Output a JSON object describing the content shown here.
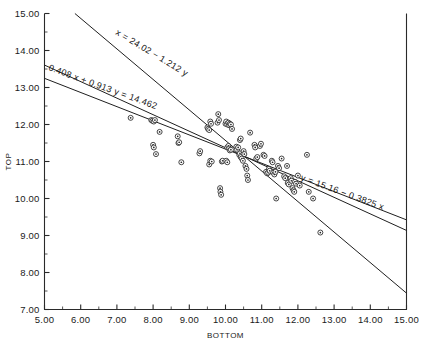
{
  "chart_data": {
    "type": "scatter",
    "title": "",
    "xlabel": "BOTTOM",
    "ylabel": "TOP",
    "xlim": [
      5.0,
      15.0
    ],
    "ylim": [
      7.0,
      15.0
    ],
    "xticks": [
      5.0,
      6.0,
      7.0,
      8.0,
      9.0,
      10.0,
      11.0,
      12.0,
      13.0,
      14.0,
      15.0
    ],
    "yticks": [
      7.0,
      8.0,
      9.0,
      10.0,
      11.0,
      12.0,
      13.0,
      14.0,
      15.0
    ],
    "xtick_labels": [
      "5.00",
      "6.00",
      "7.00",
      "8.00",
      "9.00",
      "10.00",
      "11.00",
      "12.00",
      "13.00",
      "14.00",
      "15.00"
    ],
    "ytick_labels": [
      "7.00",
      "8.00",
      "9.00",
      "10.00",
      "11.00",
      "12.00",
      "13.00",
      "14.00",
      "15.00"
    ],
    "minor_tick_step": 0.5,
    "grid": false,
    "legend": "none",
    "marker": "circle-with-center-dot",
    "points": [
      [
        7.38,
        12.18
      ],
      [
        7.95,
        12.12
      ],
      [
        7.98,
        12.1
      ],
      [
        8.02,
        12.08
      ],
      [
        8.05,
        12.12
      ],
      [
        8.0,
        11.45
      ],
      [
        8.02,
        11.38
      ],
      [
        8.08,
        11.2
      ],
      [
        8.18,
        11.8
      ],
      [
        8.68,
        11.68
      ],
      [
        8.7,
        11.5
      ],
      [
        8.72,
        11.52
      ],
      [
        8.78,
        10.98
      ],
      [
        9.28,
        11.22
      ],
      [
        9.3,
        11.28
      ],
      [
        9.5,
        11.92
      ],
      [
        9.52,
        11.88
      ],
      [
        9.55,
        11.85
      ],
      [
        9.58,
        12.08
      ],
      [
        9.6,
        12.02
      ],
      [
        9.55,
        10.92
      ],
      [
        9.58,
        11.02
      ],
      [
        9.62,
        11.0
      ],
      [
        9.78,
        12.05
      ],
      [
        9.8,
        12.28
      ],
      [
        9.82,
        12.12
      ],
      [
        9.85,
        10.28
      ],
      [
        9.86,
        10.18
      ],
      [
        9.88,
        10.1
      ],
      [
        9.9,
        11.0
      ],
      [
        9.92,
        11.02
      ],
      [
        10.0,
        12.02
      ],
      [
        10.02,
        12.08
      ],
      [
        10.05,
        12.0
      ],
      [
        10.08,
        12.05
      ],
      [
        10.1,
        11.98
      ],
      [
        10.12,
        12.02
      ],
      [
        10.15,
        12.0
      ],
      [
        10.05,
        11.38
      ],
      [
        10.08,
        11.42
      ],
      [
        10.1,
        11.35
      ],
      [
        10.12,
        11.3
      ],
      [
        10.15,
        11.32
      ],
      [
        10.02,
        11.02
      ],
      [
        10.05,
        10.98
      ],
      [
        10.18,
        11.88
      ],
      [
        10.3,
        11.4
      ],
      [
        10.32,
        11.32
      ],
      [
        10.35,
        11.38
      ],
      [
        10.4,
        11.58
      ],
      [
        10.42,
        11.62
      ],
      [
        10.38,
        11.18
      ],
      [
        10.4,
        11.22
      ],
      [
        10.42,
        11.12
      ],
      [
        10.45,
        11.08
      ],
      [
        10.48,
        11.02
      ],
      [
        10.5,
        11.28
      ],
      [
        10.52,
        11.2
      ],
      [
        10.55,
        10.88
      ],
      [
        10.58,
        10.8
      ],
      [
        10.6,
        10.62
      ],
      [
        10.62,
        10.5
      ],
      [
        10.68,
        11.78
      ],
      [
        10.8,
        11.45
      ],
      [
        10.82,
        11.38
      ],
      [
        10.85,
        11.08
      ],
      [
        10.88,
        11.12
      ],
      [
        10.95,
        11.42
      ],
      [
        10.98,
        11.48
      ],
      [
        11.05,
        11.18
      ],
      [
        11.08,
        11.15
      ],
      [
        11.12,
        10.72
      ],
      [
        11.15,
        10.68
      ],
      [
        11.18,
        10.7
      ],
      [
        11.2,
        10.8
      ],
      [
        11.22,
        10.75
      ],
      [
        11.28,
        11.02
      ],
      [
        11.3,
        10.98
      ],
      [
        11.32,
        10.7
      ],
      [
        11.35,
        10.65
      ],
      [
        11.38,
        10.72
      ],
      [
        11.4,
        10.0
      ],
      [
        11.45,
        10.88
      ],
      [
        11.48,
        10.82
      ],
      [
        11.55,
        11.08
      ],
      [
        11.62,
        10.6
      ],
      [
        11.65,
        10.55
      ],
      [
        11.7,
        10.88
      ],
      [
        11.72,
        10.42
      ],
      [
        11.75,
        10.38
      ],
      [
        11.8,
        10.55
      ],
      [
        11.82,
        10.48
      ],
      [
        11.85,
        10.28
      ],
      [
        11.88,
        10.22
      ],
      [
        11.9,
        10.18
      ],
      [
        11.92,
        10.45
      ],
      [
        11.95,
        10.4
      ],
      [
        12.0,
        10.62
      ],
      [
        12.05,
        10.35
      ],
      [
        12.25,
        11.18
      ],
      [
        12.3,
        10.18
      ],
      [
        12.42,
        10.0
      ],
      [
        12.62,
        9.08
      ]
    ],
    "lines": [
      {
        "name": "x-on-y-regression",
        "equation_label": "x = 24.02 − 1.212 y",
        "intercept": 24.02,
        "slope": -1.212,
        "form": "x = a + b*y",
        "label_x": 115,
        "label_y": 34,
        "label_rotation": 31
      },
      {
        "name": "orthogonal-regression",
        "equation_label": "0.408 x + 0.913 y = 14.462",
        "coef_x": 0.408,
        "coef_y": 0.913,
        "constant": 14.462,
        "form": "a*x + b*y = c",
        "label_x": 48,
        "label_y": 70,
        "label_rotation": 20
      },
      {
        "name": "y-on-x-regression",
        "equation_label": "y = 15.16 − 0.3825 x",
        "intercept": 15.16,
        "slope": -0.3825,
        "form": "y = a + b*x",
        "label_x": 300,
        "label_y": 180,
        "label_rotation": 20
      }
    ]
  }
}
